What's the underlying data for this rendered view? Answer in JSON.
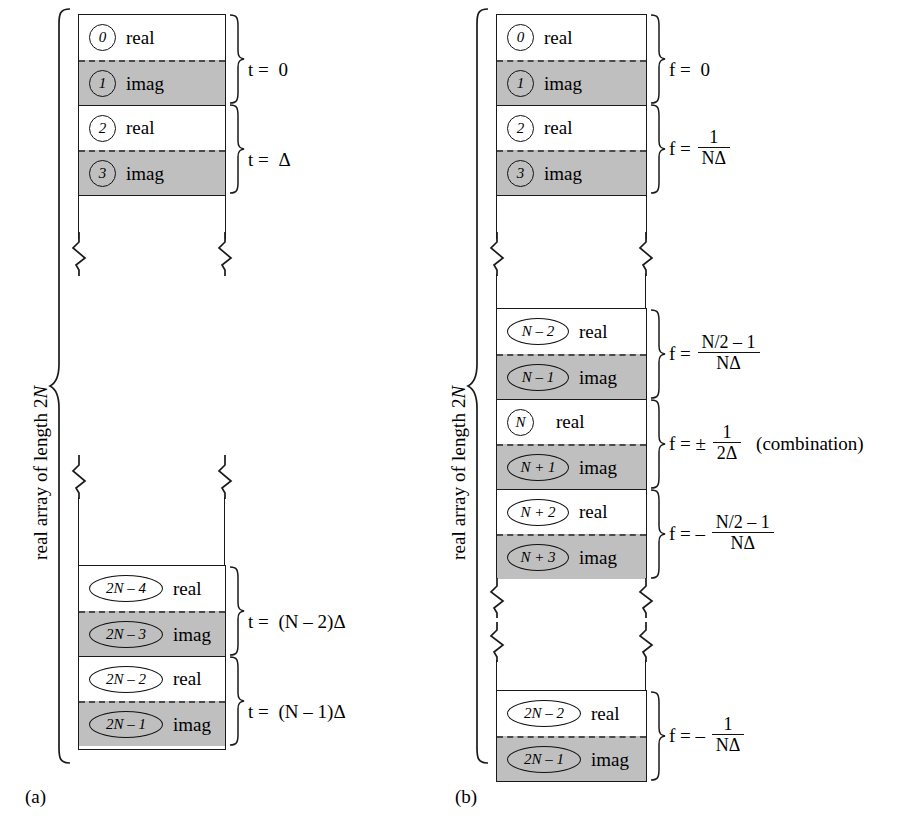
{
  "figure": {
    "caption_a": "(a)",
    "caption_b": "(b)",
    "vertical_label": "real array of length 2N"
  },
  "panel_a": {
    "id": "a",
    "array_label": "real array of length 2N",
    "groups": [
      {
        "name": "t0",
        "cells": [
          {
            "index": "0",
            "type": "real",
            "label": "real"
          },
          {
            "index": "1",
            "type": "imag",
            "label": "imag"
          }
        ],
        "equation": {
          "lhs": "t =",
          "value": "0",
          "kind": "plain"
        }
      },
      {
        "name": "tdelta",
        "cells": [
          {
            "index": "2",
            "type": "real",
            "label": "real"
          },
          {
            "index": "3",
            "type": "imag",
            "label": "imag"
          }
        ],
        "equation": {
          "lhs": "t =",
          "value": "Δ",
          "kind": "plain"
        }
      },
      {
        "name": "tn2",
        "cells": [
          {
            "index": "2N – 4",
            "type": "real",
            "label": "real"
          },
          {
            "index": "2N – 3",
            "type": "imag",
            "label": "imag"
          }
        ],
        "equation": {
          "lhs": "t =",
          "value": "(N – 2)Δ",
          "kind": "plain"
        }
      },
      {
        "name": "tn1",
        "cells": [
          {
            "index": "2N – 2",
            "type": "real",
            "label": "real"
          },
          {
            "index": "2N – 1",
            "type": "imag",
            "label": "imag"
          }
        ],
        "equation": {
          "lhs": "t =",
          "value": "(N – 1)Δ",
          "kind": "plain"
        }
      }
    ]
  },
  "panel_b": {
    "id": "b",
    "array_label": "real array of length 2N",
    "groups": [
      {
        "name": "f0",
        "cells": [
          {
            "index": "0",
            "type": "real",
            "label": "real"
          },
          {
            "index": "1",
            "type": "imag",
            "label": "imag"
          }
        ],
        "equation": {
          "lhs": "f =",
          "value": "0",
          "kind": "plain"
        }
      },
      {
        "name": "f1nd",
        "cells": [
          {
            "index": "2",
            "type": "real",
            "label": "real"
          },
          {
            "index": "3",
            "type": "imag",
            "label": "imag"
          }
        ],
        "equation": {
          "lhs": "f =",
          "kind": "frac",
          "num": "1",
          "den": "NΔ"
        }
      },
      {
        "name": "fn2m1",
        "cells": [
          {
            "index": "N – 2",
            "type": "real",
            "label": "real"
          },
          {
            "index": "N – 1",
            "type": "imag",
            "label": "imag"
          }
        ],
        "equation": {
          "lhs": "f =",
          "kind": "frac",
          "num": "N/2 – 1",
          "den": "NΔ"
        }
      },
      {
        "name": "fnyquist",
        "cells": [
          {
            "index": "N",
            "type": "real",
            "label": "real"
          },
          {
            "index": "N + 1",
            "type": "imag",
            "label": "imag"
          }
        ],
        "equation": {
          "lhs": "f = ±",
          "kind": "frac",
          "num": "1",
          "den": "2Δ",
          "tail": "(combination)"
        }
      },
      {
        "name": "fnegn2m1",
        "cells": [
          {
            "index": "N + 2",
            "type": "real",
            "label": "real"
          },
          {
            "index": "N + 3",
            "type": "imag",
            "label": "imag"
          }
        ],
        "equation": {
          "lhs": "f = –",
          "kind": "frac",
          "num": "N/2 – 1",
          "den": "NΔ"
        }
      },
      {
        "name": "fneg1nd",
        "cells": [
          {
            "index": "2N – 2",
            "type": "real",
            "label": "real"
          },
          {
            "index": "2N – 1",
            "type": "imag",
            "label": "imag"
          }
        ],
        "equation": {
          "lhs": "f = –",
          "kind": "frac",
          "num": "1",
          "den": "NΔ"
        }
      }
    ]
  },
  "colors": {
    "imag_fill": "#bfbfbf",
    "real_fill": "#ffffff",
    "stroke": "#1a1a1a",
    "dash": "#4a4a4a"
  }
}
